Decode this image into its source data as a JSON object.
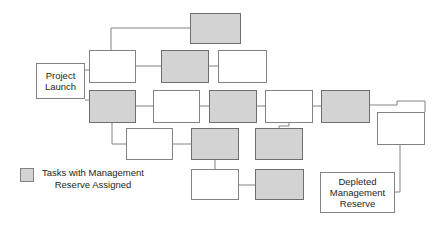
{
  "diagram": {
    "title_text": "",
    "colors": {
      "reserve_fill": "#d3d3d3",
      "task_fill": "#ffffff",
      "stroke": "#808285",
      "text": "#231f20"
    },
    "nodes": [
      {
        "id": "project-launch",
        "label": "Project\nLaunch",
        "type": "milestone",
        "fill": "white",
        "x": 36,
        "y": 63,
        "w": 49,
        "h": 36
      },
      {
        "id": "task-top-reserve",
        "label": "",
        "type": "task",
        "fill": "gray",
        "x": 190,
        "y": 13,
        "w": 51,
        "h": 31
      },
      {
        "id": "task-r2-c1",
        "label": "",
        "type": "task",
        "fill": "white",
        "x": 89,
        "y": 50,
        "w": 47,
        "h": 33
      },
      {
        "id": "task-r2-c2",
        "label": "",
        "type": "task",
        "fill": "gray",
        "x": 161,
        "y": 50,
        "w": 48,
        "h": 33
      },
      {
        "id": "task-r2-c3",
        "label": "",
        "type": "task",
        "fill": "white",
        "x": 218,
        "y": 50,
        "w": 49,
        "h": 33
      },
      {
        "id": "task-r3-c1",
        "label": "",
        "type": "task",
        "fill": "gray",
        "x": 89,
        "y": 90,
        "w": 47,
        "h": 33
      },
      {
        "id": "task-r3-c2",
        "label": "",
        "type": "task",
        "fill": "white",
        "x": 153,
        "y": 90,
        "w": 47,
        "h": 33
      },
      {
        "id": "task-r3-c3",
        "label": "",
        "type": "task",
        "fill": "gray",
        "x": 209,
        "y": 90,
        "w": 48,
        "h": 33
      },
      {
        "id": "task-r3-c4",
        "label": "",
        "type": "task",
        "fill": "white",
        "x": 265,
        "y": 90,
        "w": 48,
        "h": 33
      },
      {
        "id": "task-r3-c5",
        "label": "",
        "type": "task",
        "fill": "gray",
        "x": 321,
        "y": 90,
        "w": 49,
        "h": 33
      },
      {
        "id": "task-r3-c6",
        "label": "",
        "type": "task",
        "fill": "white",
        "x": 377,
        "y": 112,
        "w": 48,
        "h": 33
      },
      {
        "id": "task-r4-c1",
        "label": "",
        "type": "task",
        "fill": "white",
        "x": 126,
        "y": 128,
        "w": 47,
        "h": 32
      },
      {
        "id": "task-r4-c2",
        "label": "",
        "type": "task",
        "fill": "gray",
        "x": 191,
        "y": 128,
        "w": 48,
        "h": 32
      },
      {
        "id": "task-r4-c3",
        "label": "",
        "type": "task",
        "fill": "gray",
        "x": 255,
        "y": 128,
        "w": 48,
        "h": 32
      },
      {
        "id": "task-r5-c1",
        "label": "",
        "type": "task",
        "fill": "white",
        "x": 191,
        "y": 169,
        "w": 48,
        "h": 31
      },
      {
        "id": "task-r5-c2",
        "label": "",
        "type": "task",
        "fill": "gray",
        "x": 255,
        "y": 169,
        "w": 49,
        "h": 31
      },
      {
        "id": "depleted-reserve",
        "label": "Depleted\nManagement\nReserve",
        "type": "milestone",
        "fill": "white",
        "x": 320,
        "y": 172,
        "w": 75,
        "h": 41
      }
    ],
    "edges": [
      {
        "from": "project-launch",
        "to": "task-r2-c1"
      },
      {
        "from": "project-launch",
        "to": "task-r3-c1"
      },
      {
        "from": "task-r2-c1",
        "to": "task-top-reserve"
      },
      {
        "from": "task-r2-c1",
        "to": "task-r2-c2"
      },
      {
        "from": "task-r2-c2",
        "to": "task-r2-c3"
      },
      {
        "from": "task-r3-c1",
        "to": "task-r3-c2"
      },
      {
        "from": "task-r3-c1",
        "to": "task-r4-c1"
      },
      {
        "from": "task-r3-c2",
        "to": "task-r3-c3"
      },
      {
        "from": "task-r3-c3",
        "to": "task-r3-c4"
      },
      {
        "from": "task-r3-c4",
        "to": "task-r3-c5"
      },
      {
        "from": "task-r3-c4",
        "to": "task-r4-c3"
      },
      {
        "from": "task-r3-c5",
        "to": "task-r3-c6"
      },
      {
        "from": "task-r4-c1",
        "to": "task-r4-c2"
      },
      {
        "from": "task-r4-c2",
        "to": "task-r5-c1"
      },
      {
        "from": "task-r5-c1",
        "to": "task-r5-c2"
      },
      {
        "from": "task-r3-c6",
        "to": "depleted-reserve"
      }
    ],
    "legend": {
      "swatch_fill": "#d3d3d3",
      "line1": "Tasks with Management",
      "line2": "Reserve Assigned"
    }
  }
}
